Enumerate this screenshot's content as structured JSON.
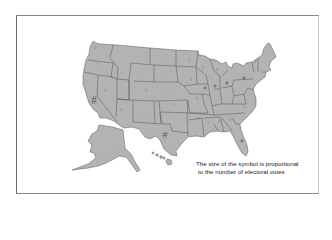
{
  "figure": {
    "type": "choropleth-symbol-map",
    "region": "United States",
    "symbol": "#",
    "fill_color": "#b3b3b3",
    "border_color": "#555555",
    "caption": {
      "line1": "The size of the symbol is proportional",
      "line2": "to the number of electoral votes"
    }
  }
}
